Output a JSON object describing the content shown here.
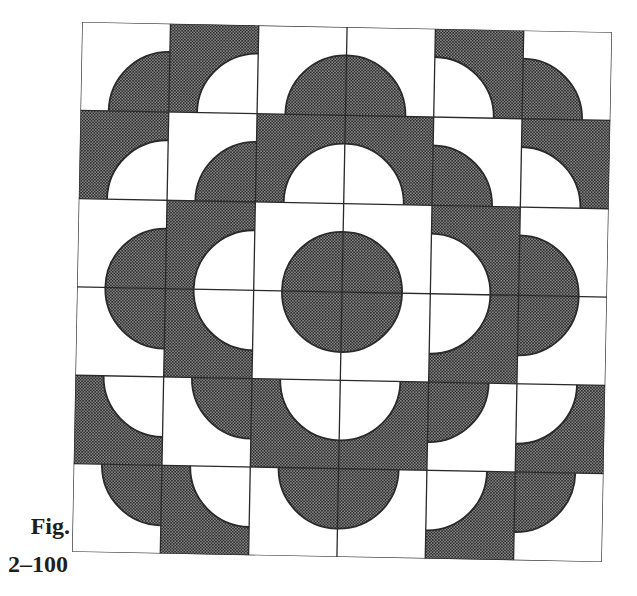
{
  "figure": {
    "label": "Fig.",
    "number": "2–100",
    "grid": {
      "rows": 6,
      "cols": 6
    },
    "colors": {
      "dark": "#555555",
      "dark_dot": "#2e2e2e",
      "dark_base": "#8a8a8a",
      "light": "#ffffff",
      "line": "#2a2a2a"
    },
    "disc_radius_ratio": 0.68,
    "tiles": [
      [
        {
          "shade": "light",
          "corner": "br"
        },
        {
          "shade": "dark",
          "corner": "br"
        },
        {
          "shade": "light",
          "corner": "br"
        },
        {
          "shade": "light",
          "corner": "bl"
        },
        {
          "shade": "dark",
          "corner": "bl"
        },
        {
          "shade": "light",
          "corner": "bl"
        }
      ],
      [
        {
          "shade": "dark",
          "corner": "br"
        },
        {
          "shade": "light",
          "corner": "br"
        },
        {
          "shade": "dark",
          "corner": "br"
        },
        {
          "shade": "dark",
          "corner": "bl"
        },
        {
          "shade": "light",
          "corner": "bl"
        },
        {
          "shade": "dark",
          "corner": "bl"
        }
      ],
      [
        {
          "shade": "light",
          "corner": "br"
        },
        {
          "shade": "dark",
          "corner": "br"
        },
        {
          "shade": "light",
          "corner": "br"
        },
        {
          "shade": "light",
          "corner": "bl"
        },
        {
          "shade": "dark",
          "corner": "bl"
        },
        {
          "shade": "light",
          "corner": "bl"
        }
      ],
      [
        {
          "shade": "light",
          "corner": "tr"
        },
        {
          "shade": "dark",
          "corner": "tr"
        },
        {
          "shade": "light",
          "corner": "tr"
        },
        {
          "shade": "light",
          "corner": "tl"
        },
        {
          "shade": "dark",
          "corner": "tl"
        },
        {
          "shade": "light",
          "corner": "tl"
        }
      ],
      [
        {
          "shade": "dark",
          "corner": "tr"
        },
        {
          "shade": "light",
          "corner": "tr"
        },
        {
          "shade": "dark",
          "corner": "tr"
        },
        {
          "shade": "dark",
          "corner": "tl"
        },
        {
          "shade": "light",
          "corner": "tl"
        },
        {
          "shade": "dark",
          "corner": "tl"
        }
      ],
      [
        {
          "shade": "light",
          "corner": "tr"
        },
        {
          "shade": "dark",
          "corner": "tr"
        },
        {
          "shade": "light",
          "corner": "tr"
        },
        {
          "shade": "light",
          "corner": "tl"
        },
        {
          "shade": "dark",
          "corner": "tl"
        },
        {
          "shade": "light",
          "corner": "tl"
        }
      ]
    ]
  }
}
